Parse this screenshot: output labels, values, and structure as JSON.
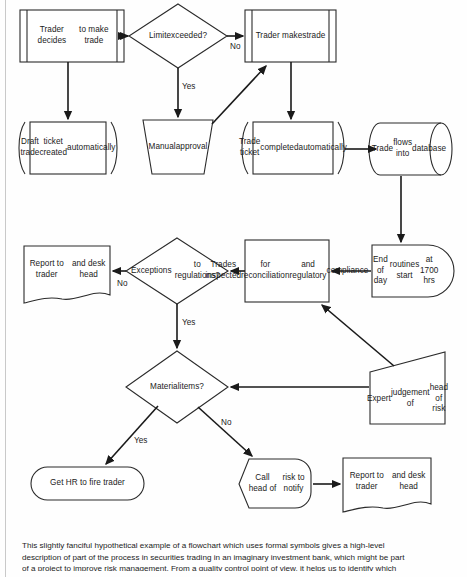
{
  "diagram": {
    "nodes": [
      {
        "id": "trader-decides",
        "label": "Trader decides\nto make trade",
        "shape": "predefined-process"
      },
      {
        "id": "limit-exceeded",
        "label": "Limit\nexceeded?",
        "shape": "decision"
      },
      {
        "id": "trader-makes",
        "label": "Trader makes\ntrade",
        "shape": "predefined-process"
      },
      {
        "id": "draft-ticket",
        "label": "Draft trade\nticket created\nautomatically",
        "shape": "loop-annotated-process"
      },
      {
        "id": "manual-approval",
        "label": "Manual\napproval",
        "shape": "manual-operation"
      },
      {
        "id": "ticket-completed",
        "label": "Trade ticket\ncompleted\nautomatically",
        "shape": "loop-annotated-process"
      },
      {
        "id": "trade-database",
        "label": "Trade\nflows into\ndatabase",
        "shape": "database-cylinder"
      },
      {
        "id": "end-of-day",
        "label": "End of day\nroutines start\nat 1700 hrs",
        "shape": "delay"
      },
      {
        "id": "trades-inspected",
        "label": "Trades inspected\nfor reconciliation\nand regulatory\ncompliance",
        "shape": "process"
      },
      {
        "id": "exceptions",
        "label": "Exceptions\nto regulations?",
        "shape": "decision"
      },
      {
        "id": "report-top",
        "label": "Report to trader\nand desk head",
        "shape": "document"
      },
      {
        "id": "material-items",
        "label": "Material\nitems?",
        "shape": "decision"
      },
      {
        "id": "expert-judgement",
        "label": "Expert\njudgement of\nhead of risk",
        "shape": "manual-input"
      },
      {
        "id": "fire-trader",
        "label": "Get HR to fire trader",
        "shape": "terminator"
      },
      {
        "id": "call-head-risk",
        "label": "Call head of\nrisk to notify",
        "shape": "loop-limit"
      },
      {
        "id": "report-bottom",
        "label": "Report to trader\nand desk head",
        "shape": "document"
      }
    ],
    "edge_labels": [
      {
        "id": "limit-no",
        "text": "No"
      },
      {
        "id": "limit-yes",
        "text": "Yes"
      },
      {
        "id": "exc-no",
        "text": "No"
      },
      {
        "id": "exc-yes",
        "text": "Yes"
      },
      {
        "id": "material-yes",
        "text": "Yes"
      },
      {
        "id": "material-no",
        "text": "No"
      }
    ]
  },
  "caption": {
    "line1": "This slightly fanciful hypothetical example of a flowchart which uses formal symbols gives a high-level",
    "line2": "description of part of the process in securities trading in an imaginary investment bank, which might be part",
    "line3": "of a project to improve risk management. From a quality control point of view, it helps us to identify which"
  },
  "colors": {
    "stroke": "#2b2b2b",
    "connector": "#1a1a1a",
    "text": "#1b1b1b",
    "background": "#ffffff"
  }
}
